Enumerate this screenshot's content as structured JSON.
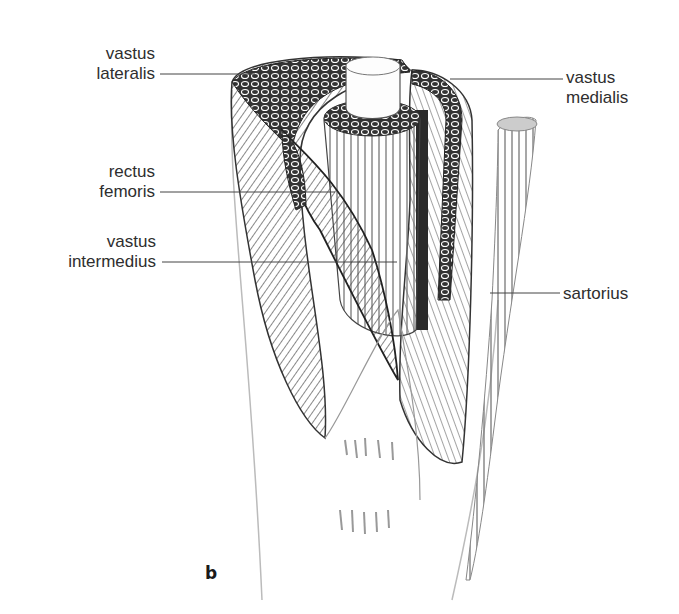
{
  "figure": {
    "panel_label": "b"
  },
  "labels": [
    {
      "id": "vastus-lateralis",
      "line1": "vastus",
      "line2": "lateralis",
      "side": "left"
    },
    {
      "id": "rectus-femoris",
      "line1": "rectus",
      "line2": "femoris",
      "side": "left"
    },
    {
      "id": "vastus-intermedius",
      "line1": "vastus",
      "line2": "intermedius",
      "side": "left"
    },
    {
      "id": "vastus-medialis",
      "line1": "vastus",
      "line2": "medialis",
      "side": "right"
    },
    {
      "id": "sartorius",
      "line1": "sartorius",
      "line2": "",
      "side": "right"
    }
  ],
  "colors": {
    "ink": "#2e2e2e",
    "shade_dark": "#3a3a3a",
    "shade_mid": "#8a8a8a",
    "shade_light": "#d8d8d8",
    "background": "#ffffff"
  }
}
